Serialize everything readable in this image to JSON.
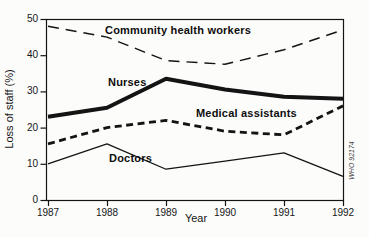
{
  "colors": {
    "ink": "#141414",
    "paper": "#fcfcfb"
  },
  "chart_data": {
    "type": "line",
    "x": [
      "1987",
      "1988",
      "1989",
      "1990",
      "1991",
      "1992"
    ],
    "xlabel": "Year",
    "ylabel": "Loss of staff (%)",
    "ylim": [
      0,
      50
    ],
    "yticks": [
      0,
      10,
      20,
      30,
      40,
      50
    ],
    "grid": false,
    "frame": "full-box",
    "legend_position": "inline-labels",
    "watermark": "WHO 92174",
    "series": [
      {
        "name": "Community health workers",
        "values": [
          48,
          45,
          38.5,
          37.5,
          41.5,
          47
        ],
        "style": "long-dash",
        "width": 1.4
      },
      {
        "name": "Nurses",
        "values": [
          23,
          25.5,
          33.5,
          30.5,
          28.5,
          28
        ],
        "style": "solid",
        "width": 4
      },
      {
        "name": "Medical assistants",
        "values": [
          15.5,
          20,
          22,
          19,
          18,
          26
        ],
        "style": "short-dash",
        "width": 2.8
      },
      {
        "name": "Doctors",
        "values": [
          10,
          15.5,
          8.5,
          10.75,
          13,
          6.5
        ],
        "style": "solid",
        "width": 1.3
      }
    ]
  }
}
